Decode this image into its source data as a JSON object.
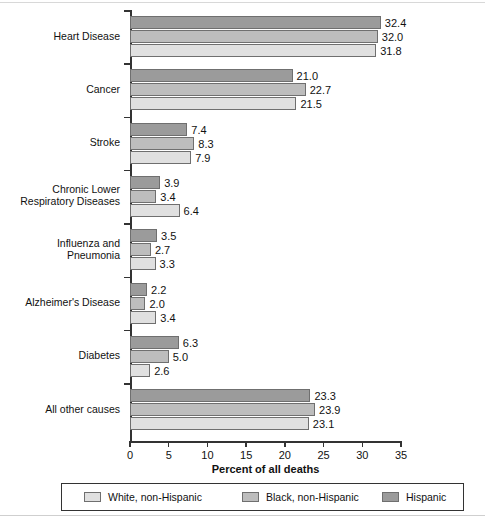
{
  "chart_data": {
    "type": "bar",
    "orientation": "horizontal",
    "title": "",
    "xlabel": "Percent of all deaths",
    "ylabel": "",
    "xlim": [
      0,
      35
    ],
    "xticks": [
      0,
      5,
      10,
      15,
      20,
      25,
      30,
      35
    ],
    "grid": false,
    "legend_position": "bottom",
    "categories": [
      "Heart Disease",
      "Cancer",
      "Stroke",
      "Chronic Lower\nRespiratory Diseases",
      "Influenza and\nPneumonia",
      "Alzheimer's Disease",
      "Diabetes",
      "All other causes"
    ],
    "series": [
      {
        "name": "Hispanic",
        "color": "#9b9b9b",
        "values": [
          32.4,
          21.0,
          7.4,
          3.9,
          3.5,
          2.2,
          6.3,
          23.3
        ],
        "labels": [
          "32.4",
          "21.0",
          "7.4",
          "3.9",
          "3.5",
          "2.2",
          "6.3",
          "23.3"
        ]
      },
      {
        "name": "Black, non-Hispanic",
        "color": "#bdbdbd",
        "values": [
          32.0,
          22.7,
          8.3,
          3.4,
          2.7,
          2.0,
          5.0,
          23.9
        ],
        "labels": [
          "32.0",
          "22.7",
          "8.3",
          "3.4",
          "2.7",
          "2.0",
          "5.0",
          "23.9"
        ]
      },
      {
        "name": "White, non-Hispanic",
        "color": "#e0e0e0",
        "values": [
          31.8,
          21.5,
          7.9,
          6.4,
          3.3,
          3.4,
          2.6,
          23.1
        ],
        "labels": [
          "31.8",
          "21.5",
          "7.9",
          "6.4",
          "3.3",
          "3.4",
          "2.6",
          "23.1"
        ]
      }
    ],
    "legend_order": [
      "White, non-Hispanic",
      "Black, non-Hispanic",
      "Hispanic"
    ]
  }
}
